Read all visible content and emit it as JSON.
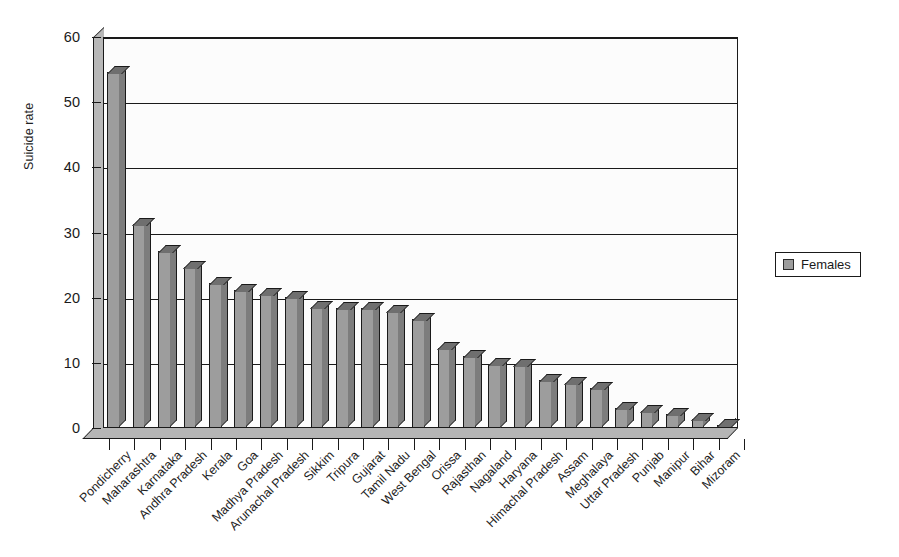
{
  "chart_data": {
    "type": "bar",
    "title": "",
    "xlabel": "",
    "ylabel": "Suicide rate",
    "ylim": [
      0,
      60
    ],
    "yticks": [
      0,
      10,
      20,
      30,
      40,
      50,
      60
    ],
    "grid": true,
    "legend_position": "right",
    "categories": [
      "Pondicherry",
      "Maharashtra",
      "Karnataka",
      "Andhra Pradesh",
      "Kerala",
      "Goa",
      "Madhya Pradesh",
      "Arunachal Pradesh",
      "Sikkim",
      "Tripura",
      "Gujarat",
      "Tamil Nadu",
      "West Bengal",
      "Orissa",
      "Rajasthan",
      "Nagaland",
      "Haryana",
      "Himachal Pradesh",
      "Assam",
      "Meghalaya",
      "Uttar Pradesh",
      "Punjab",
      "Manipur",
      "Bihar",
      "Mizoram"
    ],
    "series": [
      {
        "name": "Females",
        "color": "#9d9d9d",
        "values": [
          54.6,
          31.3,
          27.2,
          24.7,
          22.3,
          21.2,
          20.5,
          20.1,
          18.5,
          18.4,
          18.4,
          17.9,
          16.8,
          12.3,
          11.1,
          9.9,
          9.6,
          7.4,
          6.9,
          6.1,
          3.0,
          2.6,
          2.2,
          1.4,
          0.4
        ]
      }
    ]
  },
  "legend": {
    "entries": [
      {
        "label": "Females",
        "swatch_color": "#9d9d9d"
      }
    ]
  },
  "axes": {
    "y_title": "Suicide rate",
    "y_tick_labels": [
      "0",
      "10",
      "20",
      "30",
      "40",
      "50",
      "60"
    ]
  },
  "colors": {
    "bar_face": "#9d9d9d",
    "bar_top": "#6f6f6f",
    "bar_side": "#7d7d7d",
    "outline": "#1a1a1a",
    "plot_background": "#fdfdfd",
    "page_background": "#ffffff"
  }
}
